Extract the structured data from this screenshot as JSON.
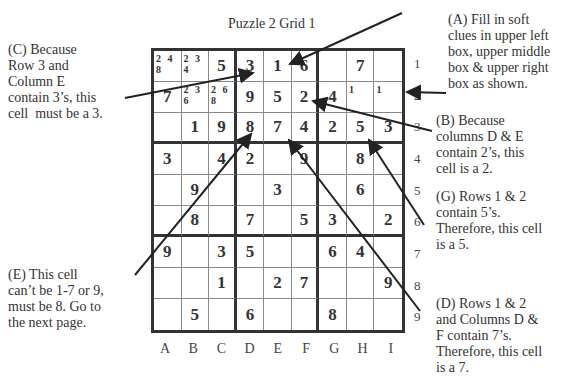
{
  "title": "Puzzle 2 Grid 1",
  "notes": {
    "A": "(A) Fill in soft\nclues in upper left\nbox, upper middle\nbox & upper right\nbox as shown.",
    "B": "(B) Because\ncolumns D & E\ncontain 2’s, this\ncell is a 2.",
    "C": "(C) Because\nRow 3 and\nColumn E\ncontain 3’s, this\ncell  must be a 3.",
    "D": "(D) Rows 1 & 2\nand Columns D &\nF contain 7’s.\nTherefore, this cell\nis a 7.",
    "E": "(E) This cell\ncan’t be 1-7 or 9,\nmust be 8. Go to\nthe next page.",
    "G": "(G) Rows 1 & 2\ncontain 5’s.\nTherefore, this cell\nis a 5."
  },
  "columns": [
    "A",
    "B",
    "C",
    "D",
    "E",
    "F",
    "G",
    "H",
    "I"
  ],
  "rows": [
    "1",
    "2",
    "3",
    "4",
    "5",
    "6",
    "7",
    "8",
    "9"
  ],
  "grid": [
    [
      "",
      "",
      "5",
      "3",
      "1",
      "6",
      "",
      "7",
      ""
    ],
    [
      "7",
      "",
      "",
      "9",
      "5",
      "2",
      "4",
      "",
      ""
    ],
    [
      "",
      "1",
      "9",
      "8",
      "7",
      "4",
      "2",
      "5",
      "3"
    ],
    [
      "3",
      "",
      "4",
      "2",
      "",
      "9",
      "",
      "8",
      ""
    ],
    [
      "",
      "9",
      "",
      "",
      "3",
      "",
      "",
      "6",
      ""
    ],
    [
      "",
      "8",
      "",
      "7",
      "",
      "5",
      "3",
      "",
      "2"
    ],
    [
      "9",
      "",
      "3",
      "5",
      "",
      "",
      "6",
      "4",
      ""
    ],
    [
      "",
      "",
      "1",
      "",
      "2",
      "7",
      "",
      "",
      "9"
    ],
    [
      "",
      "5",
      "",
      "6",
      "",
      "",
      "8",
      "",
      ""
    ]
  ],
  "candidates": {
    "0-0": "2 4\n8",
    "0-1": "2 3\n4",
    "1-1": "2 3\n6",
    "1-2": "2 6\n8",
    "1-7": "1",
    "1-8": "1"
  }
}
